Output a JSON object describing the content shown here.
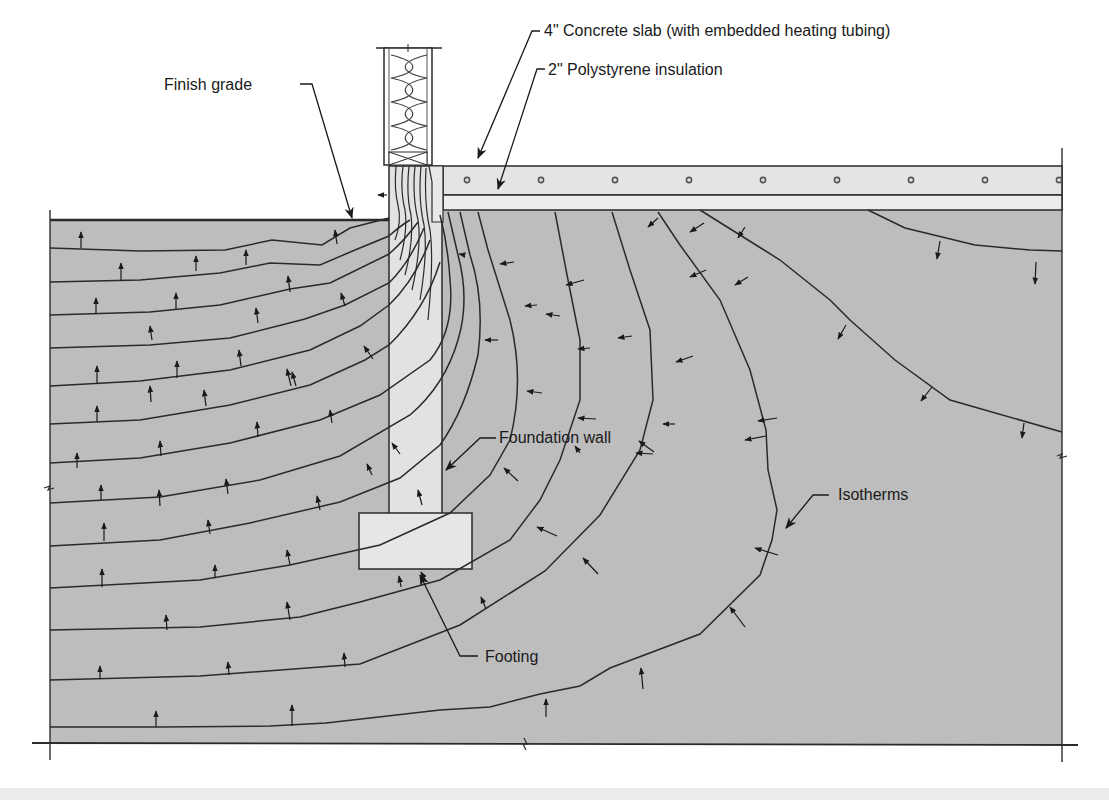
{
  "diagram": {
    "title": "",
    "colors": {
      "soil": "#bdbdbd",
      "concrete": "#e4e4e4",
      "insulation": "#ececec",
      "line": "#2a2a2a",
      "background": "#ffffff"
    },
    "labels": {
      "concrete_slab": "4\" Concrete slab (with embedded heating tubing)",
      "polystyrene": "2\" Polystyrene insulation",
      "finish_grade": "Finish grade",
      "foundation_wall": "Foundation wall",
      "isotherms": "Isotherms",
      "footing": "Footing"
    },
    "components": [
      {
        "name": "wall-framing-with-batt-insulation"
      },
      {
        "name": "concrete-slab",
        "thickness": "4\"",
        "embedded": "heating tubing",
        "tube_count": 9
      },
      {
        "name": "polystyrene-insulation",
        "thickness": "2\""
      },
      {
        "name": "foundation-wall"
      },
      {
        "name": "footing"
      },
      {
        "name": "soil"
      },
      {
        "name": "isotherms",
        "left_family_count": 12,
        "right_family_count": 8
      }
    ]
  }
}
